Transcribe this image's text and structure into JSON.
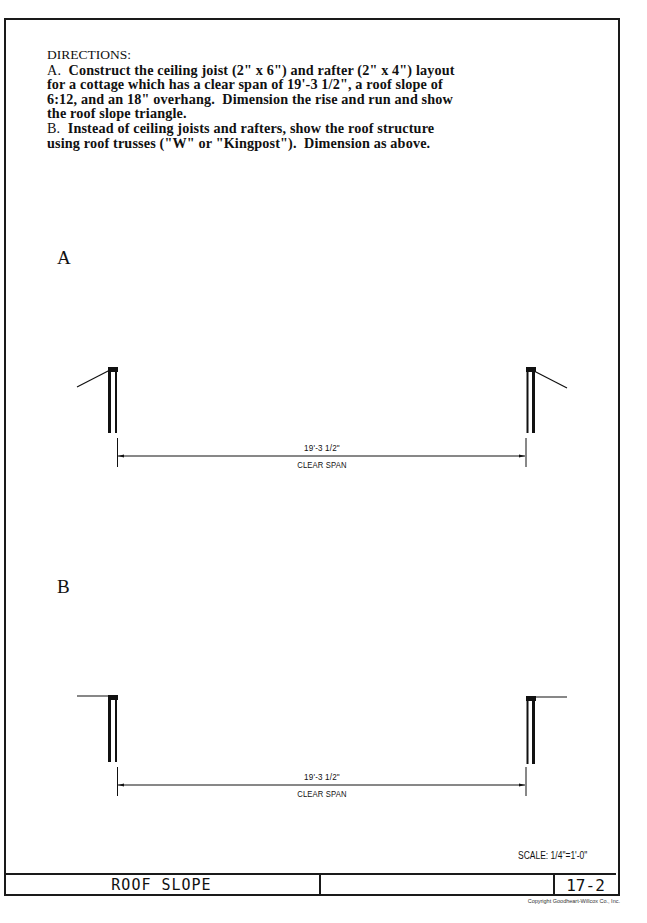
{
  "worksheet": {
    "directions": {
      "heading": "DIRECTIONS:",
      "lines": [
        {
          "label": "A.",
          "text": "  Construct the ceiling joist (2\" x 6\") and rafter (2\" x 4\") layout"
        },
        {
          "label": "",
          "text": "for a cottage which has a clear span of 19'-3 1/2\", a roof slope of"
        },
        {
          "label": "",
          "text": "6:12, and an 18\" overhang.  Dimension the rise and run and show"
        },
        {
          "label": "",
          "text": "the roof slope triangle."
        },
        {
          "label": "B.",
          "text": "  Instead of ceiling joists and rafters, show the roof structure"
        },
        {
          "label": "",
          "text": "using roof trusses (\"W\" or \"Kingpost\").  Dimension as above."
        }
      ]
    },
    "sections": [
      {
        "label": "A",
        "dimension_value": "19'-3 1/2\"",
        "dimension_caption": "CLEAR SPAN",
        "roof_style": "sloped rafter stubs"
      },
      {
        "label": "B",
        "dimension_value": "19'-3 1/2\"",
        "dimension_caption": "CLEAR SPAN",
        "roof_style": "flat truss chord stubs"
      }
    ],
    "scale": "SCALE: 1/4\"=1'-0\"",
    "title_block": {
      "title": "ROOF SLOPE",
      "middle": "",
      "sheet_number": "17-2"
    },
    "copyright": "Copyright Goodheart-Willcox Co., Inc."
  }
}
